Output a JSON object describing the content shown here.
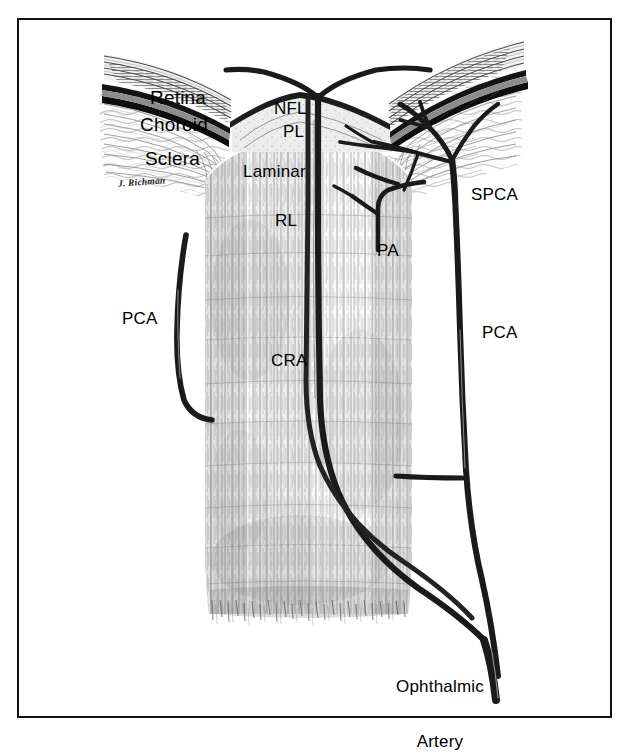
{
  "figure": {
    "kind": "anatomical-illustration",
    "frame_color": "#111111",
    "background_color": "#ffffff",
    "ink_color": "#1a1a1a",
    "signature": "J. Richman"
  },
  "labels": {
    "retina": "Retina",
    "choroid": "Choroid",
    "sclera": "Sclera",
    "nfl": "NFL",
    "pl": "PL",
    "laminar": "Laminar",
    "rl": "RL",
    "cra": "CRA",
    "pa": "PA",
    "spca": "SPCA",
    "pca_left": "PCA",
    "pca_right": "PCA",
    "ophthalmic_artery_line1": "Ophthalmic",
    "ophthalmic_artery_line2": "Artery"
  },
  "structures": [
    {
      "name": "retina",
      "label": "Retina",
      "type": "tissue-layer",
      "side": "both"
    },
    {
      "name": "choroid",
      "label": "Choroid",
      "type": "vascular-layer",
      "side": "both"
    },
    {
      "name": "sclera",
      "label": "Sclera",
      "type": "tissue-layer",
      "side": "both"
    },
    {
      "name": "nerve-fiber-layer",
      "label": "NFL",
      "type": "optic-nerve-region"
    },
    {
      "name": "prelaminar",
      "label": "PL",
      "type": "optic-nerve-region"
    },
    {
      "name": "laminar",
      "label": "Laminar",
      "type": "optic-nerve-region"
    },
    {
      "name": "retrolaminar",
      "label": "RL",
      "type": "optic-nerve-region"
    },
    {
      "name": "central-retinal-artery",
      "label": "CRA",
      "type": "artery"
    },
    {
      "name": "pial-artery",
      "label": "PA",
      "type": "artery"
    },
    {
      "name": "short-posterior-ciliary-artery",
      "label": "SPCA",
      "type": "artery"
    },
    {
      "name": "posterior-ciliary-artery-left",
      "label": "PCA",
      "type": "artery"
    },
    {
      "name": "posterior-ciliary-artery-right",
      "label": "PCA",
      "type": "artery"
    },
    {
      "name": "ophthalmic-artery",
      "label": "Ophthalmic Artery",
      "type": "artery"
    }
  ]
}
